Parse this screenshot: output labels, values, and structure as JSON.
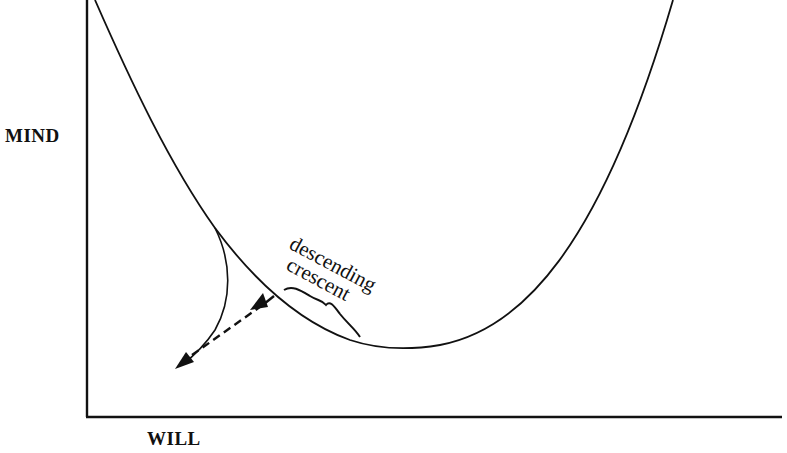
{
  "diagram": {
    "axes": {
      "y_label": "MIND",
      "x_label": "WILL"
    },
    "annotation": {
      "line1": "descending",
      "line2": "crescent"
    },
    "elements": [
      "main-curve (U-shaped, descending from top-left then rising to top-right)",
      "branch-curve (splits off the descending limb, curving down-left)",
      "dashed-double-arrow (between branch end and main curve)",
      "curly-brace (marks the descending crescent segment)"
    ],
    "colors": {
      "ink": "#111111",
      "background": "#ffffff"
    }
  }
}
